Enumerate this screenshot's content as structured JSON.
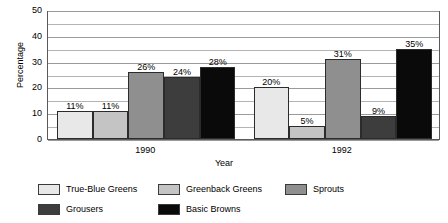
{
  "chart_data": {
    "type": "bar",
    "title": "",
    "xlabel": "Year",
    "ylabel": "Percentage",
    "categories": [
      "1990",
      "1992"
    ],
    "ylim": [
      0,
      50
    ],
    "yticks": [
      0,
      10,
      20,
      30,
      40,
      50
    ],
    "ytick_labels": [
      "0",
      "10",
      "20",
      "30",
      "40",
      "50"
    ],
    "gridline_interval": 5,
    "grid": true,
    "legend_position": "bottom",
    "value_suffix": "%",
    "series": [
      {
        "name": "True-Blue Greens",
        "color": "#e8e8e8",
        "values": [
          11,
          20
        ],
        "labels": [
          "11%",
          "20%"
        ]
      },
      {
        "name": "Greenback Greens",
        "color": "#c4c4c4",
        "values": [
          11,
          5
        ],
        "labels": [
          "11%",
          "5%"
        ]
      },
      {
        "name": "Sprouts",
        "color": "#8f8f8f",
        "values": [
          26,
          31
        ],
        "labels": [
          "26%",
          "31%"
        ]
      },
      {
        "name": "Grousers",
        "color": "#3d3d3d",
        "values": [
          24,
          9
        ],
        "labels": [
          "24%",
          "9%"
        ]
      },
      {
        "name": "Basic Browns",
        "color": "#0a0a0a",
        "values": [
          28,
          35
        ],
        "labels": [
          "28%",
          "35%"
        ]
      }
    ]
  },
  "axes": {
    "y_title": "Percentage",
    "x_title": "Year",
    "y_labels": [
      "50",
      "40",
      "30",
      "20",
      "10",
      "0"
    ],
    "x_labels": [
      "1990",
      "1992"
    ]
  },
  "legend": {
    "items": [
      {
        "label": "True-Blue Greens",
        "color": "#e8e8e8"
      },
      {
        "label": "Greenback Greens",
        "color": "#c4c4c4"
      },
      {
        "label": "Sprouts",
        "color": "#8f8f8f"
      },
      {
        "label": "Grousers",
        "color": "#3d3d3d"
      },
      {
        "label": "Basic Browns",
        "color": "#0a0a0a"
      }
    ]
  },
  "colors": {
    "plot_border": "#5a5a5a",
    "gridline": "#b4b4b4",
    "bar_border": "#2b2b2b",
    "background": "#ffffff",
    "text": "#000000"
  }
}
